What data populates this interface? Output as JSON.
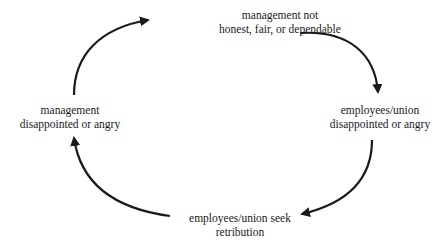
{
  "diagram": {
    "type": "cycle",
    "nodes": [
      {
        "id": "top",
        "lines": [
          "management not",
          "honest, fair, or dependable"
        ]
      },
      {
        "id": "right",
        "lines": [
          "employees/union",
          "disappointed or angry"
        ]
      },
      {
        "id": "bottom",
        "lines": [
          "employees/union seek",
          "retribution"
        ]
      },
      {
        "id": "left",
        "lines": [
          "management",
          "disappointed or angry"
        ]
      }
    ],
    "edges": [
      {
        "from": "top",
        "to": "right"
      },
      {
        "from": "right",
        "to": "bottom"
      },
      {
        "from": "bottom",
        "to": "left"
      },
      {
        "from": "left",
        "to": "top"
      }
    ],
    "colors": {
      "line": "#1a1a1a",
      "text": "#1a1a1a",
      "background": "#ffffff"
    }
  }
}
